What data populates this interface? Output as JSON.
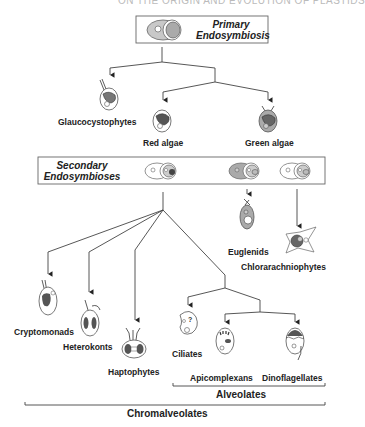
{
  "page": {
    "running_header": "ON THE ORIGIN AND EVOLUTION OF PLASTIDS"
  },
  "diagram": {
    "primary_box": {
      "title_line1": "Primary",
      "title_line2": "Endosymbiosis"
    },
    "secondary_box": {
      "title_line1": "Secondary",
      "title_line2": "Endosymbioses"
    },
    "primary_lineages": [
      {
        "label": "Glaucocystophytes"
      },
      {
        "label": "Red algae"
      },
      {
        "label": "Green algae"
      }
    ],
    "green_secondary_lineages": [
      {
        "label": "Euglenids"
      },
      {
        "label": "Chlorarachniophytes"
      }
    ],
    "red_secondary_lineages": [
      {
        "label": "Cryptomonads"
      },
      {
        "label": "Heterokonts"
      },
      {
        "label": "Haptophytes"
      },
      {
        "label": "Ciliates"
      },
      {
        "label": "Apicomplexans"
      },
      {
        "label": "Dinoflagellates"
      }
    ],
    "groups": {
      "alveolates": "Alveolates",
      "chromalveolates": "Chromalveolates"
    },
    "colors": {
      "line": "#333333",
      "box_border": "#555555",
      "cell_grey": "#9a9a9a",
      "plastid_dark": "#4a4a4a"
    }
  }
}
